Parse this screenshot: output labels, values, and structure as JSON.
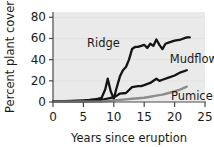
{
  "chart_data": {
    "type": "line",
    "title": "",
    "xlabel": "Years since eruption",
    "ylabel": "Percent plant cover",
    "xlim": [
      0,
      25
    ],
    "ylim": [
      0,
      85
    ],
    "xticks": [
      0,
      5,
      10,
      15,
      20,
      25
    ],
    "yticks": [
      0,
      20,
      40,
      60,
      80
    ],
    "xtick_labels": [
      "0",
      "5",
      "10",
      "15",
      "20",
      "25"
    ],
    "ytick_labels": [
      "0",
      "20",
      "40",
      "60",
      "80"
    ],
    "grid": "horizontal",
    "legend_position": "inline-labels",
    "plot_background": "#eaeaea",
    "series": [
      {
        "name": "Ridge",
        "color": "#141414",
        "label_x": 11.0,
        "label_y": 56,
        "x": [
          0,
          1,
          2,
          3,
          4,
          5,
          6,
          7,
          8,
          8.6,
          9.0,
          9.5,
          10.0,
          10.4,
          11.0,
          11.5,
          12.0,
          12.5,
          13.0,
          13.5,
          14.0,
          15.0,
          15.5,
          16.0,
          16.5,
          17.0,
          17.5,
          18.0,
          18.5,
          19.0,
          20.0,
          21.0,
          22.0,
          22.5
        ],
        "values": [
          0.5,
          0.7,
          0.9,
          1.1,
          1.3,
          1.6,
          2.0,
          2.6,
          4.0,
          12.0,
          22.0,
          10.0,
          3.0,
          12.0,
          24.0,
          30.0,
          33.0,
          40.0,
          50.0,
          52.0,
          52.0,
          54.0,
          51.0,
          55.0,
          53.0,
          59.0,
          54.0,
          50.0,
          55.0,
          56.0,
          58.0,
          59.0,
          61.0,
          61.0
        ]
      },
      {
        "name": "Mudflow",
        "color": "#141414",
        "label_x": 19.2,
        "label_y": 41,
        "x": [
          0,
          2,
          4,
          6,
          7,
          8,
          9,
          10,
          10.5,
          11.0,
          12.0,
          13.0,
          14.0,
          14.5,
          15.0,
          16.0,
          17.0,
          17.5,
          18.0,
          19.0,
          20.0,
          21.0,
          22.0
        ],
        "values": [
          0.3,
          0.4,
          0.6,
          0.9,
          1.2,
          2.0,
          3.2,
          4.5,
          6.0,
          8.0,
          8.5,
          14.0,
          15.0,
          15.0,
          16.0,
          18.0,
          22.0,
          20.0,
          21.0,
          23.0,
          25.0,
          28.0,
          30.0
        ]
      },
      {
        "name": "Pumice",
        "color": "#8c8c8c",
        "label_x": 19.4,
        "label_y": 6,
        "x": [
          0,
          3,
          6,
          8,
          9,
          10,
          11,
          12,
          13,
          14,
          15,
          16,
          17,
          18,
          19,
          20,
          21,
          22
        ],
        "values": [
          0.2,
          0.3,
          0.4,
          0.6,
          1.0,
          1.5,
          2.0,
          2.5,
          3.0,
          3.5,
          4.0,
          5.0,
          6.0,
          7.0,
          8.5,
          10.0,
          12.0,
          14.5
        ]
      }
    ]
  }
}
